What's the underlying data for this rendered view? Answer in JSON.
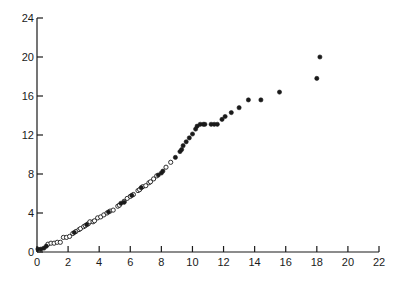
{
  "chart_data": {
    "type": "scatter",
    "title": "",
    "xlabel": "",
    "ylabel": "",
    "xlim": [
      0,
      22
    ],
    "ylim": [
      0,
      24
    ],
    "grid": false,
    "legend": null,
    "x_ticks": [
      0,
      2,
      4,
      6,
      8,
      10,
      12,
      14,
      16,
      18,
      20,
      22
    ],
    "y_ticks": [
      0,
      4,
      8,
      12,
      16,
      20,
      24
    ],
    "marker_styles": {
      "open": "hollow circle",
      "filled": "solid black circle"
    },
    "series": [
      {
        "name": "open",
        "marker": "open",
        "points": [
          [
            0.7,
            0.8
          ],
          [
            0.9,
            0.9
          ],
          [
            1.1,
            0.9
          ],
          [
            1.3,
            1.0
          ],
          [
            1.5,
            1.0
          ],
          [
            1.7,
            1.5
          ],
          [
            1.9,
            1.5
          ],
          [
            2.1,
            1.6
          ],
          [
            2.3,
            1.9
          ],
          [
            2.5,
            2.1
          ],
          [
            2.7,
            2.3
          ],
          [
            2.8,
            2.4
          ],
          [
            3.0,
            2.6
          ],
          [
            3.1,
            2.7
          ],
          [
            3.3,
            2.9
          ],
          [
            3.4,
            3.1
          ],
          [
            3.6,
            3.1
          ],
          [
            3.7,
            3.2
          ],
          [
            3.9,
            3.5
          ],
          [
            4.1,
            3.6
          ],
          [
            4.3,
            3.8
          ],
          [
            4.5,
            4.0
          ],
          [
            4.7,
            4.2
          ],
          [
            4.9,
            4.3
          ],
          [
            5.2,
            4.7
          ],
          [
            5.3,
            4.8
          ],
          [
            5.6,
            5.2
          ],
          [
            5.8,
            5.5
          ],
          [
            6.0,
            5.7
          ],
          [
            6.2,
            5.9
          ],
          [
            6.5,
            6.3
          ],
          [
            6.6,
            6.4
          ],
          [
            6.8,
            6.7
          ],
          [
            7.0,
            6.8
          ],
          [
            7.2,
            7.1
          ],
          [
            7.3,
            7.2
          ],
          [
            7.5,
            7.5
          ],
          [
            7.7,
            7.8
          ],
          [
            8.3,
            8.7
          ],
          [
            8.6,
            9.2
          ]
        ]
      },
      {
        "name": "filled",
        "marker": "filled",
        "points": [
          [
            0.06,
            0.3
          ],
          [
            0.26,
            0.3
          ],
          [
            0.45,
            0.4
          ],
          [
            0.6,
            0.6
          ],
          [
            2.4,
            2.0
          ],
          [
            3.2,
            2.8
          ],
          [
            4.6,
            4.1
          ],
          [
            5.4,
            5.0
          ],
          [
            5.6,
            5.1
          ],
          [
            6.1,
            5.8
          ],
          [
            6.7,
            6.6
          ],
          [
            7.8,
            7.9
          ],
          [
            8.0,
            8.1
          ],
          [
            8.1,
            8.3
          ],
          [
            8.9,
            9.7
          ],
          [
            9.2,
            10.3
          ],
          [
            9.3,
            10.5
          ],
          [
            9.4,
            10.9
          ],
          [
            9.6,
            11.3
          ],
          [
            9.8,
            11.7
          ],
          [
            10.0,
            12.1
          ],
          [
            10.2,
            12.6
          ],
          [
            10.3,
            12.9
          ],
          [
            10.5,
            13.1
          ],
          [
            10.7,
            13.1
          ],
          [
            10.8,
            13.1
          ],
          [
            11.2,
            13.1
          ],
          [
            11.4,
            13.1
          ],
          [
            11.6,
            13.1
          ],
          [
            11.9,
            13.6
          ],
          [
            12.1,
            13.9
          ],
          [
            12.5,
            14.3
          ],
          [
            13.0,
            14.8
          ],
          [
            13.6,
            15.6
          ],
          [
            14.4,
            15.6
          ],
          [
            15.6,
            16.4
          ],
          [
            18.0,
            17.8
          ],
          [
            18.2,
            20.0
          ]
        ]
      }
    ]
  }
}
